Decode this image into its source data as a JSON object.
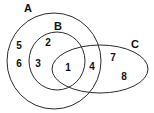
{
  "diagram": {
    "type": "venn-euler",
    "background_color": "#ffffff",
    "stroke_color": "#2b2b2b",
    "label_color": "#111111",
    "sets": [
      {
        "id": "A",
        "label": "A",
        "shape": "circle",
        "label_x": 28,
        "label_y": 9,
        "cx": 54,
        "cy": 61,
        "rx": 47,
        "ry": 48,
        "rotation": 0
      },
      {
        "id": "B",
        "label": "B",
        "shape": "circle",
        "label_x": 58,
        "label_y": 27,
        "cx": 57,
        "cy": 61,
        "rx": 28,
        "ry": 29,
        "rotation": 0
      },
      {
        "id": "C",
        "label": "C",
        "shape": "ellipse",
        "label_x": 135,
        "label_y": 45,
        "cx": 100,
        "cy": 69,
        "rx": 48,
        "ry": 24,
        "rotation": 0
      }
    ],
    "regions": [
      {
        "id": "r1",
        "label": "1",
        "x": 68,
        "y": 68,
        "meaning": "A and B and C"
      },
      {
        "id": "r2",
        "label": "2",
        "x": 48,
        "y": 43,
        "meaning": "B only (inside A), not C"
      },
      {
        "id": "r3",
        "label": "3",
        "x": 38,
        "y": 64,
        "meaning": "B only (inside A), not C"
      },
      {
        "id": "r4",
        "label": "4",
        "x": 92,
        "y": 67,
        "meaning": "A and C, not B"
      },
      {
        "id": "r5",
        "label": "5",
        "x": 19,
        "y": 46,
        "meaning": "A only"
      },
      {
        "id": "r6",
        "label": "6",
        "x": 19,
        "y": 64,
        "meaning": "A only"
      },
      {
        "id": "r7",
        "label": "7",
        "x": 113,
        "y": 58,
        "meaning": "C only"
      },
      {
        "id": "r8",
        "label": "8",
        "x": 124,
        "y": 77,
        "meaning": "C only"
      }
    ]
  }
}
